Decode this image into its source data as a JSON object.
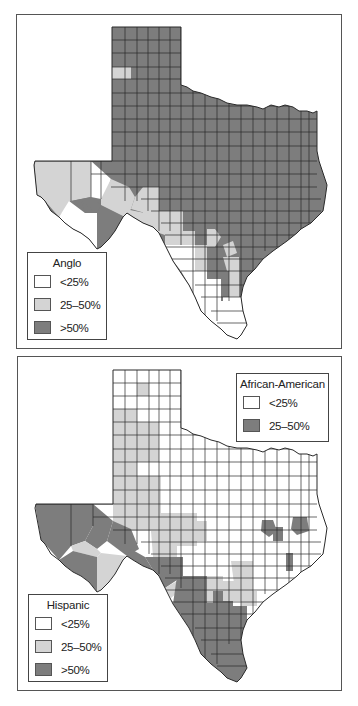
{
  "colors": {
    "low": "#ffffff",
    "mid": "#d4d4d4",
    "high": "#7d7d7d",
    "border": "#2a2a2a",
    "frame": "#555555"
  },
  "maps": [
    {
      "id": "anglo",
      "legend": {
        "title": "Anglo",
        "items": [
          {
            "label": "<25%",
            "class": "low"
          },
          {
            "label": "25–50%",
            "class": "mid"
          },
          {
            "label": ">50%",
            "class": "high"
          }
        ]
      }
    },
    {
      "id": "hispanic-african-american",
      "legends": [
        {
          "title": "African-American",
          "items": [
            {
              "label": "<25%",
              "class": "low"
            },
            {
              "label": "25–50%",
              "class": "high"
            }
          ]
        },
        {
          "title": "Hispanic",
          "items": [
            {
              "label": "<25%",
              "class": "low"
            },
            {
              "label": "25–50%",
              "class": "mid"
            },
            {
              "label": ">50%",
              "class": "high"
            }
          ]
        }
      ]
    }
  ]
}
